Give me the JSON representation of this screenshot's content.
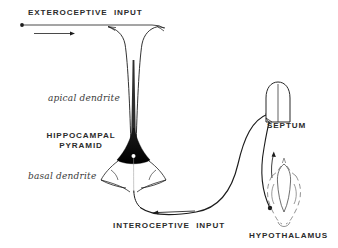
{
  "figure": {
    "background_color": "#ffffff",
    "ink_color": "#1c1c1c",
    "label_color": "#2b2b2b"
  },
  "labels": {
    "exteroceptive_input": "EXTEROCEPTIVE  INPUT",
    "apical_dendrite": "apical dendrite",
    "hippocampal_pyramid_line1": "HIPPOCAMPAL",
    "hippocampal_pyramid_line2": "PYRAMID",
    "basal_dendrite": "basal dendrite",
    "interoceptive_input": "INTEROCEPTIVE  INPUT",
    "septum": "SEPTUM",
    "hypothalamus": "HYPOTHALAMUS"
  },
  "structures": [
    {
      "id": "hippocampal-pyramid",
      "name": "HIPPOCAMPAL PYRAMID",
      "parts": [
        "apical dendrite",
        "soma",
        "nucleus",
        "basal dendrite",
        "axon"
      ]
    },
    {
      "id": "septum",
      "name": "SEPTUM",
      "shape": "dome"
    },
    {
      "id": "hypothalamus",
      "name": "HYPOTHALAMUS",
      "shape": "dashed-outline-with-ventricle"
    }
  ],
  "pathways": [
    {
      "id": "exteroceptive-afferent",
      "from": "EXTEROCEPTIVE  INPUT",
      "to": "apical dendrite",
      "direction": "rightward"
    },
    {
      "id": "interoceptive-afferent",
      "from": "INTEROCEPTIVE  INPUT",
      "to": "basal dendrite",
      "direction": "leftward"
    },
    {
      "id": "pyramid-to-septum",
      "from": "HIPPOCAMPAL PYRAMID",
      "to": "SEPTUM",
      "direction": "rightward-up"
    },
    {
      "id": "hypothalamus-to-septum",
      "from": "HYPOTHALAMUS",
      "to": "SEPTUM",
      "direction": "upward"
    }
  ]
}
